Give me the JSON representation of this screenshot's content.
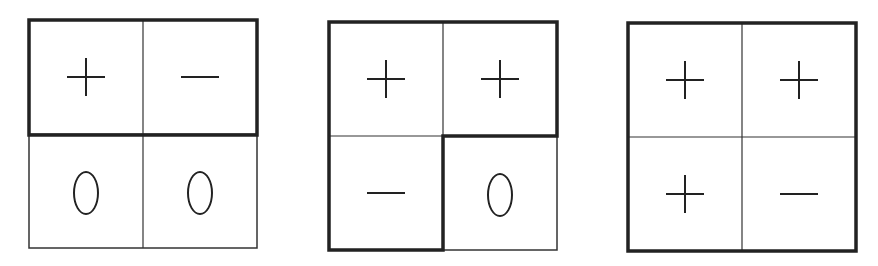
{
  "figures": [
    {
      "id": "grid-1",
      "cells": [
        {
          "pos": "top-left",
          "symbol": "plus",
          "text": "+"
        },
        {
          "pos": "top-right",
          "symbol": "minus",
          "text": "−"
        },
        {
          "pos": "bottom-left",
          "symbol": "zero",
          "text": "0"
        },
        {
          "pos": "bottom-right",
          "symbol": "zero",
          "text": "0"
        }
      ],
      "highlight": "top row (thick border)"
    },
    {
      "id": "grid-2",
      "cells": [
        {
          "pos": "top-left",
          "symbol": "plus",
          "text": "+"
        },
        {
          "pos": "top-right",
          "symbol": "plus",
          "text": "+"
        },
        {
          "pos": "bottom-left",
          "symbol": "minus",
          "text": "−"
        },
        {
          "pos": "bottom-right",
          "symbol": "zero",
          "text": "0"
        }
      ],
      "highlight": "L-shape: top row + bottom-left (thick border)"
    },
    {
      "id": "grid-3",
      "cells": [
        {
          "pos": "top-left",
          "symbol": "plus",
          "text": "+"
        },
        {
          "pos": "top-right",
          "symbol": "plus",
          "text": "+"
        },
        {
          "pos": "bottom-left",
          "symbol": "plus",
          "text": "+"
        },
        {
          "pos": "bottom-right",
          "symbol": "minus",
          "text": "−"
        }
      ],
      "highlight": "whole grid (thick border)"
    }
  ],
  "colors": {
    "line": "#222222",
    "background": "#ffffff"
  }
}
